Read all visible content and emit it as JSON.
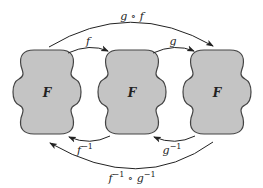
{
  "diagram": {
    "nodes": [
      {
        "label": "F"
      },
      {
        "label": "F"
      },
      {
        "label": "F"
      }
    ],
    "arrows": {
      "top_long": {
        "label": "g ∘ f"
      },
      "top_left": {
        "label": "f"
      },
      "top_right": {
        "label": "g"
      },
      "bottom_left": {
        "label": "f",
        "sup": "−1"
      },
      "bottom_right": {
        "label": "g",
        "sup": "−1"
      },
      "bottom_long": {
        "label": "f",
        "sup1": "−1",
        "mid": " ∘ g",
        "sup2": "−1"
      }
    },
    "colors": {
      "fill": "#c4c4c4",
      "stroke": "#444444",
      "arrow": "#222222"
    }
  }
}
